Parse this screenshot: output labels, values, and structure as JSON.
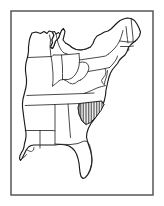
{
  "figure": {
    "title": "Outline map of the eastern United States",
    "caption": "Black-and-white line map of the eastern United States with state boundaries; one state is filled with vertical hatching.",
    "highlighted_state": "South Carolina",
    "highlight_style": "vertical-hatch",
    "region": "Eastern United States"
  },
  "frame": {
    "visible": true,
    "stroke_color": "#4a4a4a",
    "stroke_width": 1.4,
    "fill_color": "#ffffff",
    "x": 11,
    "y": 11,
    "width": 142,
    "height": 184
  },
  "style": {
    "background_color": "#ffffff",
    "coastline_color": "#1a1a1a",
    "border_color": "#2b2b2b",
    "state_fill": "#ffffff",
    "hatch_color": "#262626",
    "coastline_width": 1.15,
    "border_width": 0.85,
    "hatch_width": 0.75,
    "hatch_spacing": 1.6
  },
  "states": [
    {
      "code": "WI",
      "name": "Wisconsin",
      "highlighted": false
    },
    {
      "code": "MI",
      "name": "Michigan",
      "highlighted": false
    },
    {
      "code": "IL",
      "name": "Illinois",
      "highlighted": false
    },
    {
      "code": "IN",
      "name": "Indiana",
      "highlighted": false
    },
    {
      "code": "OH",
      "name": "Ohio",
      "highlighted": false
    },
    {
      "code": "KY",
      "name": "Kentucky",
      "highlighted": false
    },
    {
      "code": "TN",
      "name": "Tennessee",
      "highlighted": false
    },
    {
      "code": "MS",
      "name": "Mississippi",
      "highlighted": false
    },
    {
      "code": "AL",
      "name": "Alabama",
      "highlighted": false
    },
    {
      "code": "GA",
      "name": "Georgia",
      "highlighted": false
    },
    {
      "code": "FL",
      "name": "Florida",
      "highlighted": false
    },
    {
      "code": "SC",
      "name": "South Carolina",
      "highlighted": true
    },
    {
      "code": "NC",
      "name": "North Carolina",
      "highlighted": false
    },
    {
      "code": "VA",
      "name": "Virginia",
      "highlighted": false
    },
    {
      "code": "WV",
      "name": "West Virginia",
      "highlighted": false
    },
    {
      "code": "MD",
      "name": "Maryland",
      "highlighted": false
    },
    {
      "code": "DE",
      "name": "Delaware",
      "highlighted": false
    },
    {
      "code": "PA",
      "name": "Pennsylvania",
      "highlighted": false
    },
    {
      "code": "NJ",
      "name": "New Jersey",
      "highlighted": false
    },
    {
      "code": "NY",
      "name": "New York",
      "highlighted": false
    },
    {
      "code": "CT",
      "name": "Connecticut",
      "highlighted": false
    },
    {
      "code": "RI",
      "name": "Rhode Island",
      "highlighted": false
    },
    {
      "code": "MA",
      "name": "Massachusetts",
      "highlighted": false
    },
    {
      "code": "VT",
      "name": "Vermont",
      "highlighted": false
    },
    {
      "code": "NH",
      "name": "New Hampshire",
      "highlighted": false
    },
    {
      "code": "ME",
      "name": "Maine",
      "highlighted": false
    },
    {
      "code": "LA",
      "name": "Louisiana",
      "highlighted": false
    },
    {
      "code": "AR",
      "name": "Arkansas",
      "highlighted": false
    },
    {
      "code": "MO",
      "name": "Missouri",
      "highlighted": false
    },
    {
      "code": "IA",
      "name": "Iowa",
      "highlighted": false
    }
  ]
}
